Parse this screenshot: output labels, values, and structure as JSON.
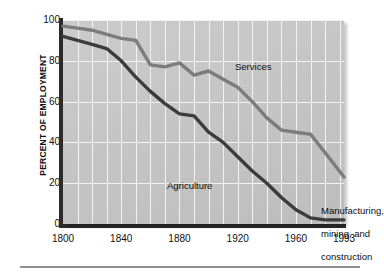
{
  "chart_data": {
    "type": "line",
    "title": "",
    "xlabel": "",
    "ylabel": "PERCENT OF EMPLOYMENT",
    "xlim": [
      1800,
      1993
    ],
    "ylim": [
      0,
      100
    ],
    "grid": true,
    "legend_position": "inline-annotations",
    "xtick_labels": [
      "1800",
      "1840",
      "1880",
      "1920",
      "1960",
      "1993"
    ],
    "xtick_values": [
      1800,
      1840,
      1880,
      1920,
      1960,
      1993
    ],
    "ytick_labels": [
      "0",
      "20",
      "40",
      "60",
      "80",
      "100"
    ],
    "ytick_values": [
      0,
      20,
      40,
      60,
      80,
      100
    ],
    "gridline_interval_years": 10,
    "series": [
      {
        "name": "Services",
        "color": "#7c7c7c",
        "x": [
          1800,
          1810,
          1820,
          1830,
          1840,
          1850,
          1860,
          1870,
          1880,
          1890,
          1900,
          1910,
          1920,
          1930,
          1940,
          1950,
          1960,
          1970,
          1980,
          1993
        ],
        "values": [
          97,
          96,
          95,
          93,
          91,
          90,
          78,
          77,
          79,
          73,
          75,
          71,
          67,
          60,
          52,
          46,
          45,
          44,
          35,
          23
        ]
      },
      {
        "name": "Agriculture",
        "color": "#3b3b3b",
        "x": [
          1800,
          1810,
          1820,
          1830,
          1840,
          1850,
          1860,
          1870,
          1880,
          1890,
          1900,
          1910,
          1920,
          1930,
          1940,
          1950,
          1960,
          1970,
          1980,
          1993
        ],
        "values": [
          92,
          90,
          88,
          86,
          80,
          72,
          65,
          59,
          54,
          53,
          45,
          40,
          33,
          26,
          20,
          13,
          7,
          3,
          2,
          2
        ]
      }
    ],
    "annotations": [
      {
        "name": "Services",
        "text": "Services"
      },
      {
        "name": "Agriculture",
        "text": "Agriculture"
      },
      {
        "name": "Manufacturing, mining, and construction",
        "text": "Manufacturing,\nmining, and\nconstruction"
      }
    ]
  },
  "colors": {
    "plot_background": "#c7c7c7",
    "gridline": "#f2f2f2",
    "axis": "#2b2b2b",
    "services_line": "#7c7c7c",
    "agriculture_line": "#3b3b3b",
    "text": "#111111",
    "rule": "#8e8e8e",
    "page_background": "#ffffff"
  },
  "axis": {
    "y_title": "PERCENT OF EMPLOYMENT"
  },
  "ticks": {
    "y": [
      "100",
      "80",
      "60",
      "40",
      "20",
      "0"
    ],
    "x": [
      "1800",
      "1840",
      "1880",
      "1920",
      "1960",
      "1993"
    ]
  },
  "labels": {
    "services": "Services",
    "agriculture": "Agriculture",
    "manufacturing_line1": "Manufacturing,",
    "manufacturing_line2": "mining, and",
    "manufacturing_line3": "construction"
  }
}
